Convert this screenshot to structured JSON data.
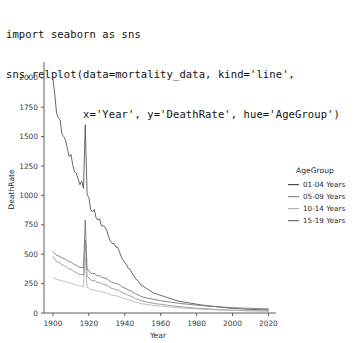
{
  "code": {
    "lines": [
      "import seaborn as sns",
      "sns.relplot(data=mortality_data, kind='line',",
      "            x='Year', y='DeathRate', hue='AgeGroup')"
    ]
  },
  "chart_data": {
    "type": "line",
    "title": "",
    "xlabel": "Year",
    "ylabel": "DeathRate",
    "xlim": [
      1895,
      2022
    ],
    "ylim": [
      0,
      2100
    ],
    "xticks": [
      1900,
      1920,
      1940,
      1960,
      1980,
      2000,
      2020
    ],
    "yticks": [
      0,
      250,
      500,
      750,
      1000,
      1250,
      1500,
      1750,
      2000
    ],
    "xticklabels": [
      "1900",
      "1920",
      "1940",
      "1960",
      "1980",
      "2000",
      "2020"
    ],
    "yticklabels": [
      "0",
      "250",
      "500",
      "750",
      "1000",
      "1250",
      "1500",
      "1750",
      "2000"
    ],
    "grid": false,
    "legend": {
      "title": "AgeGroup",
      "position": "right",
      "entries": [
        "01-04 Years",
        "05-09 Years",
        "10-14 Years",
        "15-19 Years"
      ]
    },
    "colors": [
      "#4c4c4c",
      "#8c8c8c",
      "#b4b4b4",
      "#6e6e6e"
    ],
    "x": [
      1900,
      1901,
      1902,
      1903,
      1904,
      1905,
      1906,
      1907,
      1908,
      1909,
      1910,
      1911,
      1912,
      1913,
      1914,
      1915,
      1916,
      1917,
      1918,
      1919,
      1920,
      1921,
      1922,
      1923,
      1924,
      1925,
      1926,
      1927,
      1928,
      1929,
      1930,
      1931,
      1932,
      1933,
      1934,
      1935,
      1936,
      1937,
      1938,
      1939,
      1940,
      1941,
      1942,
      1943,
      1944,
      1945,
      1946,
      1947,
      1948,
      1949,
      1950,
      1952,
      1954,
      1956,
      1958,
      1960,
      1962,
      1964,
      1966,
      1968,
      1970,
      1972,
      1974,
      1976,
      1978,
      1980,
      1982,
      1984,
      1986,
      1988,
      1990,
      1992,
      1994,
      1996,
      1998,
      2000,
      2002,
      2004,
      2006,
      2008,
      2010,
      2012,
      2014,
      2016,
      2018,
      2020
    ],
    "series": [
      {
        "name": "01-04 Years",
        "color": "#4c4c4c",
        "values": [
          1990,
          1860,
          1700,
          1660,
          1640,
          1520,
          1500,
          1470,
          1400,
          1330,
          1350,
          1260,
          1200,
          1190,
          1140,
          1090,
          1120,
          1060,
          1600,
          1010,
          980,
          880,
          860,
          880,
          810,
          790,
          800,
          740,
          740,
          730,
          700,
          650,
          610,
          590,
          590,
          560,
          560,
          520,
          480,
          450,
          430,
          410,
          380,
          370,
          340,
          320,
          290,
          280,
          260,
          240,
          230,
          210,
          190,
          170,
          160,
          150,
          140,
          130,
          120,
          110,
          100,
          95,
          90,
          85,
          80,
          75,
          70,
          66,
          62,
          58,
          55,
          52,
          48,
          45,
          42,
          40,
          38,
          36,
          34,
          32,
          31,
          30,
          29,
          28,
          27,
          26
        ]
      },
      {
        "name": "05-09 Years",
        "color": "#8c8c8c",
        "values": [
          480,
          460,
          440,
          430,
          425,
          410,
          405,
          395,
          385,
          370,
          375,
          360,
          350,
          345,
          335,
          325,
          330,
          320,
          620,
          310,
          300,
          280,
          275,
          278,
          265,
          258,
          260,
          248,
          245,
          242,
          235,
          225,
          215,
          208,
          205,
          198,
          196,
          188,
          178,
          170,
          165,
          158,
          150,
          146,
          138,
          130,
          122,
          118,
          112,
          105,
          100,
          94,
          88,
          82,
          78,
          74,
          70,
          66,
          62,
          58,
          55,
          52,
          49,
          46,
          44,
          41,
          39,
          37,
          35,
          33,
          31,
          29,
          28,
          26,
          25,
          24,
          23,
          22,
          21,
          20,
          20,
          19,
          19,
          18,
          18,
          17
        ]
      },
      {
        "name": "10-14 Years",
        "color": "#b4b4b4",
        "values": [
          300,
          292,
          286,
          282,
          278,
          272,
          270,
          266,
          260,
          254,
          256,
          248,
          242,
          240,
          234,
          228,
          230,
          224,
          470,
          218,
          212,
          200,
          196,
          198,
          190,
          185,
          186,
          178,
          176,
          174,
          170,
          163,
          157,
          152,
          150,
          146,
          144,
          138,
          132,
          126,
          122,
          118,
          112,
          108,
          104,
          98,
          92,
          89,
          85,
          80,
          77,
          73,
          69,
          65,
          62,
          59,
          56,
          53,
          50,
          48,
          45,
          43,
          41,
          39,
          37,
          35,
          33,
          32,
          30,
          29,
          27,
          26,
          25,
          24,
          23,
          22,
          21,
          21,
          20,
          19,
          19,
          18,
          18,
          17,
          17,
          16
        ]
      },
      {
        "name": "15-19 Years",
        "color": "#6e6e6e",
        "values": [
          520,
          505,
          492,
          486,
          480,
          468,
          464,
          456,
          446,
          432,
          436,
          422,
          412,
          408,
          396,
          386,
          390,
          380,
          790,
          370,
          360,
          340,
          334,
          338,
          324,
          316,
          318,
          304,
          300,
          296,
          290,
          278,
          268,
          260,
          256,
          250,
          248,
          238,
          228,
          218,
          212,
          206,
          196,
          190,
          182,
          172,
          162,
          157,
          150,
          142,
          136,
          129,
          122,
          116,
          110,
          105,
          100,
          95,
          91,
          87,
          83,
          79,
          76,
          73,
          70,
          67,
          64,
          62,
          59,
          57,
          55,
          53,
          51,
          49,
          47,
          46,
          44,
          43,
          42,
          41,
          40,
          39,
          38,
          37,
          36,
          35
        ]
      }
    ]
  }
}
